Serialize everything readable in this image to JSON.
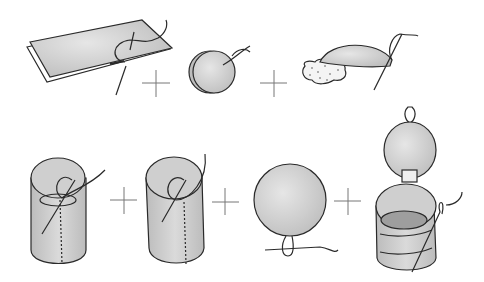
{
  "figure": {
    "title": "",
    "rows": [
      {
        "steps": [
          {
            "name": "folded-fabric-strip",
            "operator": "+"
          },
          {
            "name": "stacked-fabric-circles",
            "operator": "+"
          },
          {
            "name": "stuffed-circle-pad"
          }
        ]
      },
      {
        "steps": [
          {
            "name": "sewn-cylinder",
            "operator": "+"
          },
          {
            "name": "cylinder-with-base",
            "operator": "+"
          },
          {
            "name": "lid-circle-with-loop",
            "operator": "+"
          },
          {
            "name": "finished-container-with-lid"
          }
        ]
      }
    ],
    "colors": {
      "fabric": "#c9c9c9",
      "fabric_light": "#e2e2e2",
      "outline": "#2a2a2a",
      "plus": "#777777",
      "background": "#ffffff"
    }
  }
}
